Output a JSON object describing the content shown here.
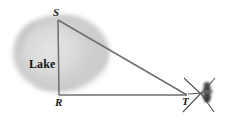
{
  "figure": {
    "kind": "geometry-diagram",
    "background_color": "#ffffff",
    "width": 227,
    "height": 120
  },
  "labels": {
    "vertex_s": "S",
    "vertex_r": "R",
    "vertex_t": "T",
    "region": "Lake"
  },
  "colors": {
    "line": "#6b6b6b",
    "line_dark": "#4d4d4d",
    "lake_fill": "#cfcfcf",
    "lake_inner": "#dcdcdc",
    "lake_edge": "#bdbdbd",
    "instrument_body": "#4a4a4a",
    "instrument_dark": "#2e2e2e",
    "text": "#1a1a1a"
  },
  "geometry": {
    "points": {
      "S": {
        "x": 58,
        "y": 20
      },
      "R": {
        "x": 59,
        "y": 95
      },
      "T": {
        "x": 187,
        "y": 95
      }
    },
    "segments": [
      {
        "name": "SR",
        "from": "S",
        "to": "R"
      },
      {
        "name": "ST",
        "from": "S",
        "to": "T"
      },
      {
        "name": "RT",
        "from": "R",
        "to": "T"
      }
    ]
  },
  "instrument": {
    "name": "theodolite",
    "tripod_legs": 4,
    "position": {
      "x": 200,
      "y": 93
    }
  }
}
